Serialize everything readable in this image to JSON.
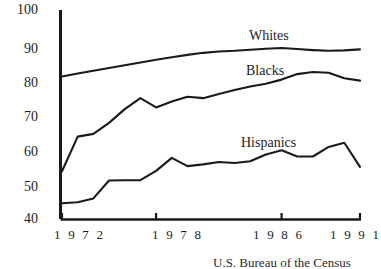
{
  "chart_data": {
    "type": "line",
    "title": "",
    "xlabel": "",
    "ylabel": "",
    "xlim": [
      1972,
      1991
    ],
    "ylim": [
      40,
      100
    ],
    "grid": false,
    "legend_position": "inline-labels",
    "x": [
      1972,
      1973,
      1974,
      1975,
      1976,
      1977,
      1978,
      1979,
      1980,
      1981,
      1982,
      1983,
      1984,
      1985,
      1986,
      1987,
      1988,
      1989,
      1990,
      1991
    ],
    "y_ticks": [
      40,
      50,
      60,
      70,
      80,
      90,
      100
    ],
    "y_tick_labels": [
      "40",
      "50",
      "60",
      "70",
      "80",
      "90",
      "100"
    ],
    "x_ticks": [
      1972,
      1978,
      1986,
      1991
    ],
    "x_tick_labels": [
      "1 9 7 2",
      "1 9 7 8",
      "1 9 8 6",
      "1 9 9 1"
    ],
    "series": [
      {
        "name": "Whites",
        "label": "Whites",
        "color": "#1a1a1a",
        "values": [
          81.5,
          82.4,
          83.2,
          84.0,
          84.8,
          85.6,
          86.4,
          87.1,
          87.8,
          88.4,
          88.8,
          89.0,
          89.3,
          89.6,
          89.8,
          89.5,
          89.2,
          89.0,
          89.1,
          89.4
        ]
      },
      {
        "name": "Blacks",
        "label": "Blacks",
        "color": "#1a1a1a",
        "values": [
          53.9,
          64.0,
          64.8,
          68.0,
          72.0,
          75.2,
          72.5,
          74.2,
          75.6,
          75.2,
          76.4,
          77.6,
          78.6,
          79.4,
          80.6,
          82.2,
          82.8,
          82.6,
          81.0,
          80.3
        ]
      },
      {
        "name": "Hispanics",
        "label": "Hispanics",
        "color": "#1a1a1a",
        "values": [
          44.6,
          44.9,
          46.0,
          51.2,
          51.3,
          51.3,
          54.0,
          57.8,
          55.4,
          55.9,
          56.6,
          56.3,
          56.8,
          58.8,
          60.0,
          58.2,
          58.2,
          61.0,
          62.2,
          55.2
        ]
      }
    ],
    "source_caption": "U.S. Bureau of the Census"
  }
}
